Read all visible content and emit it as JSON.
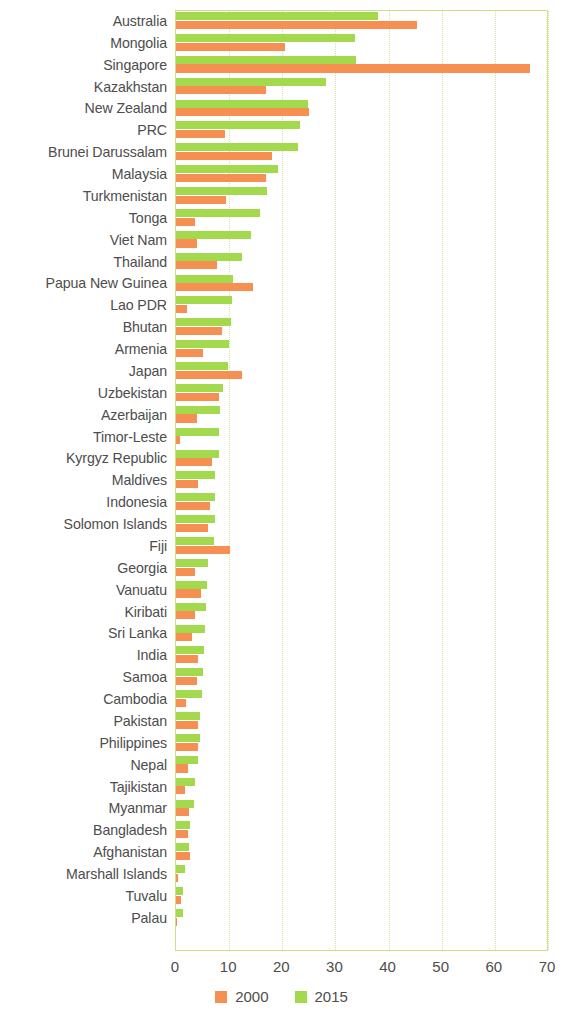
{
  "chart_data": {
    "type": "bar",
    "orientation": "horizontal",
    "title": "",
    "subtitle": "",
    "xlabel": "",
    "ylabel": "",
    "xlim": [
      0,
      70
    ],
    "xticks": [
      0,
      10,
      20,
      30,
      40,
      50,
      60,
      70
    ],
    "xtick_labels": [
      "0",
      "10",
      "20",
      "30",
      "40",
      "50",
      "60",
      "70"
    ],
    "grid": true,
    "grid_axis": "x",
    "legend_position": "bottom-center",
    "colors": {
      "2000": "#f58f52",
      "2015": "#a3da4d",
      "axis": "#cfe08a",
      "text": "#4d4d4d"
    },
    "categories": [
      "Australia",
      "Mongolia",
      "Singapore",
      "Kazakhstan",
      "New Zealand",
      "PRC",
      "Brunei Darussalam",
      "Malaysia",
      "Turkmenistan",
      "Tonga",
      "Viet Nam",
      "Thailand",
      "Papua New Guinea",
      "Lao PDR",
      "Bhutan",
      "Armenia",
      "Japan",
      "Uzbekistan",
      "Azerbaijan",
      "Timor-Leste",
      "Kyrgyz Republic",
      "Maldives",
      "Indonesia",
      "Solomon Islands",
      "Fiji",
      "Georgia",
      "Vanuatu",
      "Kiribati",
      "Sri Lanka",
      "India",
      "Samoa",
      "Cambodia",
      "Pakistan",
      "Philippines",
      "Nepal",
      "Tajikistan",
      "Myanmar",
      "Bangladesh",
      "Afghanistan",
      "Marshall Islands",
      "Tuvalu",
      "Palau"
    ],
    "series": [
      {
        "name": "2000",
        "color": "#f58f52",
        "values": [
          45.4,
          20.5,
          66.6,
          17.0,
          25.0,
          9.3,
          18.0,
          16.9,
          9.5,
          3.6,
          3.9,
          7.8,
          14.5,
          2.1,
          8.6,
          5.0,
          12.4,
          8.0,
          3.9,
          0.8,
          6.8,
          4.2,
          6.4,
          6.1,
          10.2,
          3.6,
          4.7,
          3.6,
          3.0,
          4.1,
          3.9,
          1.9,
          4.1,
          4.2,
          2.3,
          1.7,
          2.5,
          2.3,
          2.6,
          0.3,
          1.0,
          0.2
        ]
      },
      {
        "name": "2015",
        "color": "#a3da4d",
        "values": [
          38.1,
          33.6,
          33.8,
          28.3,
          24.9,
          23.4,
          23.0,
          19.1,
          17.1,
          15.9,
          14.1,
          12.5,
          10.8,
          10.6,
          10.3,
          9.9,
          9.7,
          8.8,
          8.3,
          8.1,
          8.1,
          7.4,
          7.4,
          7.3,
          7.1,
          6.1,
          5.9,
          5.6,
          5.5,
          5.2,
          5.0,
          4.8,
          4.6,
          4.6,
          4.2,
          3.6,
          3.4,
          2.7,
          2.5,
          1.6,
          1.3,
          1.3
        ]
      }
    ],
    "legend": [
      {
        "label": "2000",
        "color": "#f58f52"
      },
      {
        "label": "2015",
        "color": "#a3da4d"
      }
    ]
  }
}
